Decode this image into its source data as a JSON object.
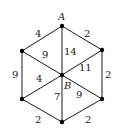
{
  "graph": {
    "vertices": [
      {
        "id": "A",
        "label": "A",
        "x": 62,
        "y": 26
      },
      {
        "id": "TL",
        "label": "",
        "x": 22,
        "y": 51
      },
      {
        "id": "TR",
        "label": "",
        "x": 102,
        "y": 50
      },
      {
        "id": "B",
        "label": "B",
        "x": 62,
        "y": 75
      },
      {
        "id": "BL",
        "label": "",
        "x": 22,
        "y": 99
      },
      {
        "id": "BR",
        "label": "",
        "x": 102,
        "y": 99
      },
      {
        "id": "BOT",
        "label": "",
        "x": 62,
        "y": 122
      }
    ],
    "edges": [
      {
        "from": "A",
        "to": "TL",
        "weight": "4"
      },
      {
        "from": "A",
        "to": "TR",
        "weight": "2"
      },
      {
        "from": "A",
        "to": "B",
        "weight": "14"
      },
      {
        "from": "TL",
        "to": "B",
        "weight": "9"
      },
      {
        "from": "TR",
        "to": "B",
        "weight": "11"
      },
      {
        "from": "TL",
        "to": "BL",
        "weight": "9"
      },
      {
        "from": "TR",
        "to": "BR",
        "weight": "2"
      },
      {
        "from": "BL",
        "to": "B",
        "weight": "4"
      },
      {
        "from": "B",
        "to": "BOT",
        "weight": "7"
      },
      {
        "from": "B",
        "to": "BR",
        "weight": "9"
      },
      {
        "from": "BL",
        "to": "BOT",
        "weight": "2"
      },
      {
        "from": "BR",
        "to": "BOT",
        "weight": "2"
      }
    ]
  }
}
